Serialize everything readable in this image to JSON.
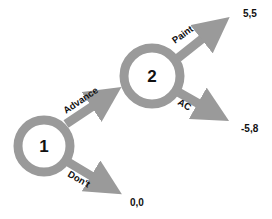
{
  "diagram": {
    "type": "game-tree",
    "colors": {
      "ring": "#9a9a9a",
      "arrow": "#9a9a9a",
      "text": "#111111",
      "background": "#ffffff"
    },
    "nodes": [
      {
        "id": "1",
        "label": "1"
      },
      {
        "id": "2",
        "label": "2"
      }
    ],
    "edges": [
      {
        "from": "1",
        "to": "2",
        "label": "Advance"
      },
      {
        "from": "1",
        "to": "terminal-0-0",
        "label": "Don't"
      },
      {
        "from": "2",
        "to": "terminal-5-5",
        "label": "Paint"
      },
      {
        "from": "2",
        "to": "terminal-neg5-8",
        "label": "AC"
      }
    ],
    "payoffs": [
      {
        "id": "terminal-5-5",
        "label": "5,5"
      },
      {
        "id": "terminal-neg5-8",
        "label": "-5,8"
      },
      {
        "id": "terminal-0-0",
        "label": "0,0"
      }
    ]
  }
}
